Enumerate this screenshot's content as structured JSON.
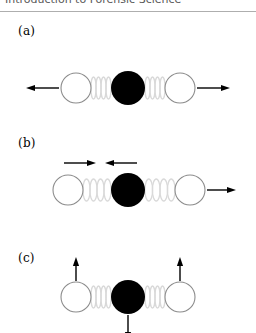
{
  "header": {
    "title": "Introduction to Forensic Science"
  },
  "figure": {
    "caption_labels": [
      "(a)",
      "(b)",
      "(c)"
    ],
    "colors": {
      "atom_outline": "#8c8c8c",
      "atom_center_fill": "#000000",
      "atom_outer_fill": "#ffffff",
      "spring": "#d9d9d9",
      "arrow": "#000000",
      "header_text": "#595959",
      "header_rule": "#aeaeae",
      "background": "#ffffff"
    },
    "panels": [
      {
        "id": "a",
        "label": "(a)",
        "mode_name": "symmetric-stretch",
        "atoms": [
          {
            "name": "atom-left",
            "fill": "outer",
            "cx": 76,
            "cy": 70,
            "r": 15
          },
          {
            "name": "atom-center",
            "fill": "center",
            "cx": 128,
            "cy": 70,
            "r": 17
          },
          {
            "name": "atom-right",
            "fill": "outer",
            "cx": 180,
            "cy": 70,
            "r": 15
          }
        ],
        "springs": [
          {
            "name": "spring-left",
            "x1": 91,
            "x2": 111,
            "cy": 70,
            "coils": 4
          },
          {
            "name": "spring-right",
            "x1": 145,
            "x2": 165,
            "cy": 70,
            "coils": 4
          }
        ],
        "arrows": [
          {
            "name": "arrow-left-outward",
            "direction": "left",
            "x1": 59,
            "y1": 70,
            "x2": 26,
            "y2": 70
          },
          {
            "name": "arrow-right-outward",
            "direction": "right",
            "x1": 197,
            "y1": 70,
            "x2": 230,
            "y2": 70
          }
        ]
      },
      {
        "id": "b",
        "label": "(b)",
        "mode_name": "asymmetric-stretch",
        "atoms": [
          {
            "name": "atom-left",
            "fill": "outer",
            "cx": 68,
            "cy": 60,
            "r": 15
          },
          {
            "name": "atom-center",
            "fill": "center",
            "cx": 128,
            "cy": 60,
            "r": 17
          },
          {
            "name": "atom-right",
            "fill": "outer",
            "cx": 190,
            "cy": 60,
            "r": 15
          }
        ],
        "springs": [
          {
            "name": "spring-left",
            "x1": 83,
            "x2": 111,
            "cy": 60,
            "coils": 4
          },
          {
            "name": "spring-right",
            "x1": 145,
            "x2": 175,
            "cy": 60,
            "coils": 4
          }
        ],
        "arrows": [
          {
            "name": "arrow-left-inward",
            "direction": "right",
            "x1": 64,
            "y1": 33,
            "x2": 96,
            "y2": 33
          },
          {
            "name": "arrow-center-inward",
            "direction": "left",
            "x1": 137,
            "y1": 33,
            "x2": 105,
            "y2": 33
          },
          {
            "name": "arrow-right-outward",
            "direction": "right",
            "x1": 207,
            "y1": 60,
            "x2": 236,
            "y2": 60
          }
        ]
      },
      {
        "id": "c",
        "label": "(c)",
        "mode_name": "bending",
        "atoms": [
          {
            "name": "atom-left",
            "fill": "outer",
            "cx": 76,
            "cy": 52,
            "r": 15
          },
          {
            "name": "atom-center",
            "fill": "center",
            "cx": 128,
            "cy": 52,
            "r": 17
          },
          {
            "name": "atom-right",
            "fill": "outer",
            "cx": 180,
            "cy": 52,
            "r": 15
          }
        ],
        "springs": [
          {
            "name": "spring-left",
            "x1": 91,
            "x2": 111,
            "cy": 52,
            "coils": 4
          },
          {
            "name": "spring-right",
            "x1": 145,
            "x2": 165,
            "cy": 52,
            "coils": 4
          }
        ],
        "arrows": [
          {
            "name": "arrow-left-up",
            "direction": "up",
            "x1": 76,
            "y1": 36,
            "x2": 76,
            "y2": 12
          },
          {
            "name": "arrow-right-up",
            "direction": "up",
            "x1": 180,
            "y1": 36,
            "x2": 180,
            "y2": 12
          },
          {
            "name": "arrow-center-down",
            "direction": "down",
            "x1": 128,
            "y1": 70,
            "x2": 128,
            "y2": 96
          }
        ]
      }
    ]
  }
}
